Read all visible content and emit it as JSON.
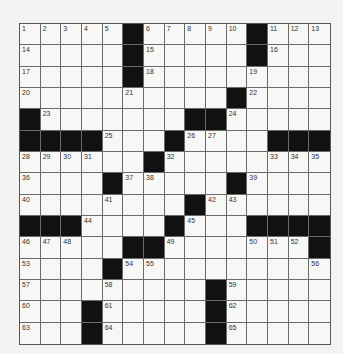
{
  "puzzle": {
    "rows": 15,
    "cols": 15,
    "colors": {
      "background": "#f3f3f1",
      "cell": "#f7f7f5",
      "block": "#111111",
      "line": "#6a6a6a",
      "number": "#333333"
    },
    "grid": [
      [
        "1",
        "2",
        "3",
        "4",
        "5",
        "#",
        "6",
        "7",
        "8",
        "9",
        "10",
        "#",
        "11",
        "12",
        "13"
      ],
      [
        "14",
        ".",
        ".",
        ".",
        ".",
        "#",
        "15",
        ".",
        ".",
        ".",
        ".",
        "#",
        "16",
        ".",
        "."
      ],
      [
        "17",
        ".",
        ".",
        ".",
        ".",
        "#",
        "18",
        ".",
        ".",
        ".",
        ".",
        "19",
        ".",
        ".",
        "."
      ],
      [
        "20",
        ".",
        ".",
        ".",
        ".",
        "21",
        ".",
        ".",
        ".",
        ".",
        "#",
        "22",
        ".",
        ".",
        "."
      ],
      [
        "#",
        "23",
        ".",
        ".",
        ".",
        ".",
        ".",
        ".",
        "#",
        "#",
        "24",
        ".",
        ".",
        ".",
        "."
      ],
      [
        "#",
        "#",
        "#",
        "#",
        "25",
        ".",
        ".",
        "#",
        "26",
        "27",
        ".",
        ".",
        "#",
        "#",
        "#"
      ],
      [
        "28",
        "29",
        "30",
        "31",
        ".",
        ".",
        "#",
        "32",
        ".",
        ".",
        ".",
        ".",
        "33",
        "34",
        "35"
      ],
      [
        "36",
        ".",
        ".",
        ".",
        "#",
        "37",
        "38",
        ".",
        ".",
        ".",
        "#",
        "39",
        ".",
        ".",
        "."
      ],
      [
        "40",
        ".",
        ".",
        ".",
        "41",
        ".",
        ".",
        ".",
        "#",
        "42",
        "43",
        ".",
        ".",
        ".",
        "."
      ],
      [
        "#",
        "#",
        "#",
        "44",
        ".",
        ".",
        ".",
        "#",
        "45",
        ".",
        ".",
        "#",
        "#",
        "#",
        "#"
      ],
      [
        "46",
        "47",
        "48",
        ".",
        ".",
        "#",
        "#",
        "49",
        ".",
        ".",
        ".",
        "50",
        "51",
        "52",
        "#"
      ],
      [
        "53",
        ".",
        ".",
        ".",
        "#",
        "54",
        "55",
        ".",
        ".",
        ".",
        ".",
        ".",
        ".",
        ".",
        "56"
      ],
      [
        "57",
        ".",
        ".",
        ".",
        "58",
        ".",
        ".",
        ".",
        ".",
        "#",
        "59",
        ".",
        ".",
        ".",
        "."
      ],
      [
        "60",
        ".",
        ".",
        "#",
        "61",
        ".",
        ".",
        ".",
        ".",
        "#",
        "62",
        ".",
        ".",
        ".",
        "."
      ],
      [
        "63",
        ".",
        ".",
        "#",
        "64",
        ".",
        ".",
        ".",
        ".",
        "#",
        "65",
        ".",
        ".",
        ".",
        "."
      ]
    ]
  }
}
